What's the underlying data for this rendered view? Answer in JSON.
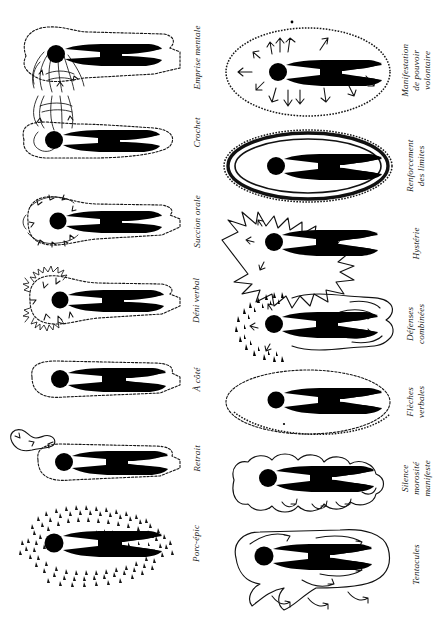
{
  "page": {
    "kind": "figure-plate",
    "language": "fr",
    "background_color": "#ffffff",
    "ink_color": "#000000",
    "orientation_note": "Planche d'illustrations : figures humaines stylisées pivotées, légendes en italique verticales",
    "columns": 2,
    "rows": 7,
    "total_figures": 14
  },
  "left_column": {
    "name": "colonne-gauche",
    "cells": [
      {
        "id": "emprise-mentale",
        "caption": "Emprise mentale",
        "caption_lines": [
          "Emprise mentale"
        ],
        "motif": "tentacules-longues-depuis-la-tete"
      },
      {
        "id": "crochet",
        "caption": "Crochet",
        "caption_lines": [
          "Crochet"
        ],
        "motif": "crochet-recourbe"
      },
      {
        "id": "succion-orale",
        "caption": "Succion orale",
        "caption_lines": [
          "Succion orale"
        ],
        "motif": "fleches-entrantes-vers-la-tete"
      },
      {
        "id": "deni-verbal",
        "caption": "Déni verbal",
        "caption_lines": [
          "Déni verbal"
        ],
        "motif": "halo-herisse-fleches-entrantes"
      },
      {
        "id": "a-cote",
        "caption": "À côté",
        "caption_lines": [
          "À côté"
        ],
        "motif": "contour-simple-decale"
      },
      {
        "id": "retrait",
        "caption": "Retrait",
        "caption_lines": [
          "Retrait"
        ],
        "motif": "retrait-excroissance-laterale"
      },
      {
        "id": "porc-epic",
        "caption": "Porc-épic",
        "caption_lines": [
          "Porc-épic"
        ],
        "motif": "piquants-denses"
      }
    ]
  },
  "right_column": {
    "name": "colonne-droite",
    "cells": [
      {
        "id": "manifestation-de-pouvoir-volontaire",
        "caption": "Manifestation de pouvoir volontaire",
        "caption_lines": [
          "Manifestation de",
          "pouvoir volontaire"
        ],
        "motif": "fleches-sortantes-halo-ovale"
      },
      {
        "id": "renforcement-des-limites",
        "caption": "Renforcement des limites",
        "caption_lines": [
          "Renforcement",
          "des limites"
        ],
        "motif": "double-paroi-epaisse"
      },
      {
        "id": "hysterie",
        "caption": "Hystérie",
        "caption_lines": [
          "Hystérie"
        ],
        "motif": "contour-dechiquete-explosif"
      },
      {
        "id": "defenses-combinees",
        "caption": "Défenses combinées",
        "caption_lines": [
          "Défenses",
          "combinées"
        ],
        "motif": "piquants-et-tentacules"
      },
      {
        "id": "fleches-verbales",
        "caption": "Flèches verbales",
        "caption_lines": [
          "Flèches",
          "verbales"
        ],
        "motif": "ovale-pointille-fin"
      },
      {
        "id": "silence-morosite-manifeste",
        "caption": "Silence morosité manifeste",
        "caption_lines": [
          "Silence",
          "morosité manifeste"
        ],
        "motif": "contour-nuageux-feston"
      },
      {
        "id": "tentacules",
        "caption": "Tentacules",
        "caption_lines": [
          "Tentacules"
        ],
        "motif": "tentacules-flechees-multiples"
      }
    ]
  }
}
